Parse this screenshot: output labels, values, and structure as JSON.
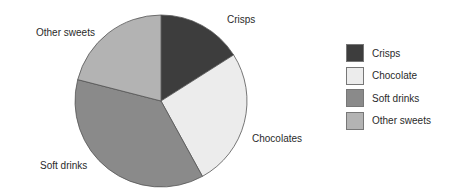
{
  "chart_data": {
    "type": "pie",
    "title": "",
    "categories": [
      "Crisps",
      "Chocolate",
      "Soft drinks",
      "Other sweets"
    ],
    "values": [
      16,
      26,
      37,
      21
    ],
    "unit": "percent (estimated)",
    "slice_labels": [
      "Crisps",
      "Chocolates",
      "Soft drinks",
      "Other sweets"
    ],
    "colors": [
      "#3d3d3d",
      "#ececec",
      "#8a8a8a",
      "#b3b3b3"
    ],
    "legend": {
      "position": "right",
      "entries": [
        "Crisps",
        "Chocolate",
        "Soft drinks",
        "Other sweets"
      ]
    },
    "start_angle": "12 o'clock",
    "direction": "clockwise"
  },
  "labels": {
    "crisps": "Crisps",
    "chocolates": "Chocolates",
    "soft_drinks": "Soft drinks",
    "other_sweets": "Other sweets"
  },
  "legend": {
    "items": [
      {
        "label": "Crisps",
        "color": "#3d3d3d"
      },
      {
        "label": "Chocolate",
        "color": "#ececec"
      },
      {
        "label": "Soft drinks",
        "color": "#8a8a8a"
      },
      {
        "label": "Other sweets",
        "color": "#b3b3b3"
      }
    ]
  }
}
